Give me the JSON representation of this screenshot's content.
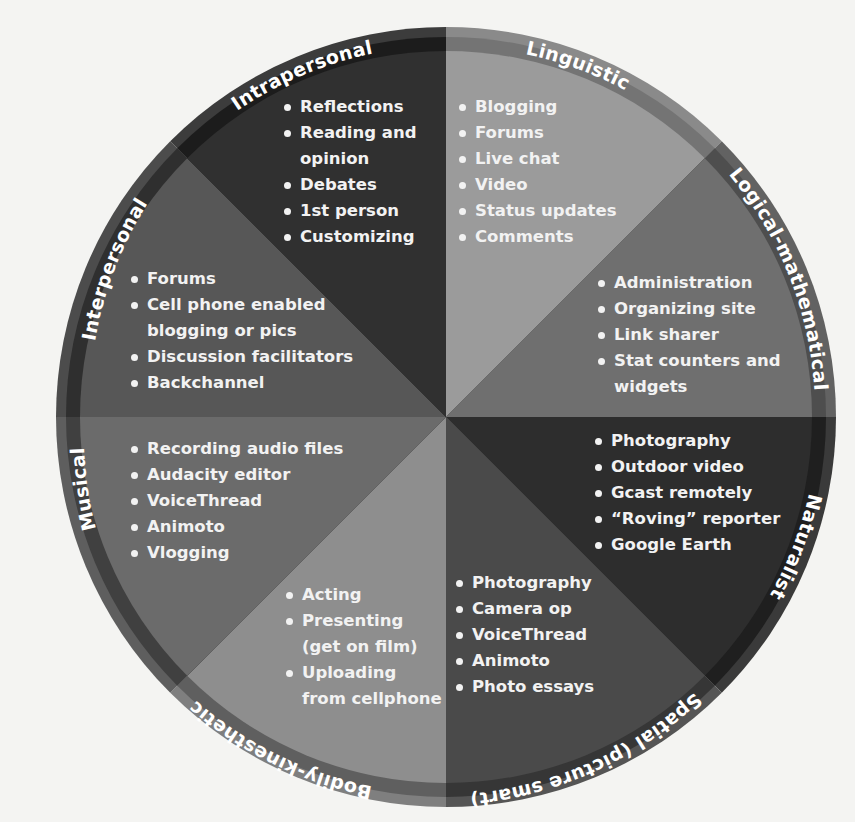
{
  "diagram": {
    "type": "pie-wheel",
    "center": [
      446,
      417
    ],
    "radius": 390,
    "segments": [
      {
        "name": "Linguistic",
        "label": "Linguistic",
        "start_deg": -90,
        "end_deg": -45,
        "fill": "#9b9b9b",
        "ring": "#8a8a8a",
        "stripe": "#747474",
        "items": [
          "Blogging",
          "Forums",
          "Live chat",
          "Video",
          "Status updates",
          "Comments"
        ]
      },
      {
        "name": "Logical-mathematical",
        "label": "Logical-mathematical",
        "start_deg": -45,
        "end_deg": 0,
        "fill": "#6f6f6f",
        "ring": "#626262",
        "stripe": "#4e4e4e",
        "items": [
          "Administration",
          "Organizing site",
          "Link sharer",
          "Stat counters and",
          "widgets"
        ]
      },
      {
        "name": "Naturalist",
        "label": "Naturalist",
        "start_deg": 0,
        "end_deg": 45,
        "fill": "#2d2d2d",
        "ring": "#3a3a3a",
        "stripe": "#1f1f1f",
        "items": [
          "Photography",
          "Outdoor video",
          "Gcast remotely",
          "“Roving” reporter",
          "Google Earth"
        ]
      },
      {
        "name": "Spatial",
        "label": "Spatial (picture smart)",
        "start_deg": 45,
        "end_deg": 90,
        "fill": "#4a4a4a",
        "ring": "#555555",
        "stripe": "#363636",
        "items": [
          "Photography",
          "Camera op",
          "VoiceThread",
          "Animoto",
          "Photo essays"
        ]
      },
      {
        "name": "Bodily-kinesthetic",
        "label": "Bodily-kinesthetic",
        "start_deg": 90,
        "end_deg": 135,
        "fill": "#8e8e8e",
        "ring": "#7f7f7f",
        "stripe": "#5f5f5f",
        "items": [
          "Acting",
          "Presenting",
          "(get on film)",
          "Uploading",
          "from cellphone"
        ]
      },
      {
        "name": "Musical",
        "label": "Musical",
        "start_deg": 135,
        "end_deg": 180,
        "fill": "#6b6b6b",
        "ring": "#5e5e5e",
        "stripe": "#404040",
        "items": [
          "Recording audio files",
          "Audacity editor",
          "VoiceThread",
          "Animoto",
          "Vlogging"
        ]
      },
      {
        "name": "Interpersonal",
        "label": "Interpersonal",
        "start_deg": 180,
        "end_deg": 225,
        "fill": "#575757",
        "ring": "#4c4c4c",
        "stripe": "#2f2f2f",
        "items": [
          "Forums",
          "Cell phone enabled",
          "blogging or pics",
          "Discussion facilitators",
          "Backchannel"
        ]
      },
      {
        "name": "Intrapersonal",
        "label": "Intrapersonal",
        "start_deg": 225,
        "end_deg": 270,
        "fill": "#303030",
        "ring": "#3c3c3c",
        "stripe": "#1c1c1c",
        "items": [
          "Reflections",
          "Reading and",
          "opinion",
          "Debates",
          "1st person",
          "Customizing"
        ]
      }
    ]
  }
}
